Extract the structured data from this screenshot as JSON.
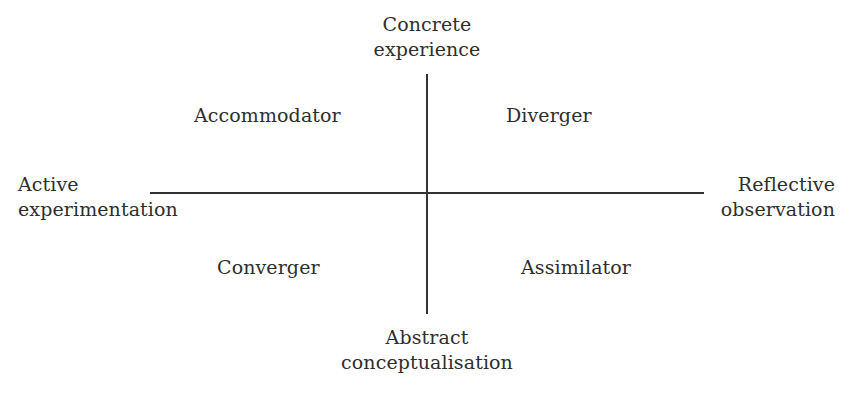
{
  "diagram": {
    "type": "quadrant",
    "axes": {
      "vertical": {
        "top": [
          "Concrete",
          "experience"
        ],
        "bottom": [
          "Abstract",
          "conceptualisation"
        ]
      },
      "horizontal": {
        "left": [
          "Active",
          "experimentation"
        ],
        "right": [
          "Reflective",
          "observation"
        ]
      }
    },
    "quadrants": {
      "top_left": "Accommodator",
      "top_right": "Diverger",
      "bottom_left": "Converger",
      "bottom_right": "Assimilator"
    },
    "colors": {
      "line": "#333333",
      "text": "#2e2e2e",
      "background": "#ffffff"
    }
  }
}
